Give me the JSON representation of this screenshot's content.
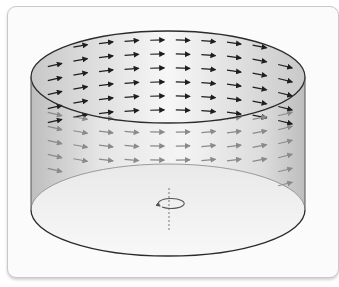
{
  "figure": {
    "field": {
      "description": "tangential velocity vectors on the cylinder surface",
      "rows": 6,
      "columns": 10,
      "back_rows_on_top_band": 6,
      "direction": "rightward, curving around the axis"
    },
    "axis": {
      "icon": "rotation-arrow-icon",
      "style": "dashed vertical axis"
    },
    "colors": {
      "outline": "#2b2b2b",
      "arrow_dark": "#1e1e1e",
      "arrow_light": "#8a8a8a",
      "card_border": "#c9c9c9",
      "axis": "#777777"
    }
  }
}
